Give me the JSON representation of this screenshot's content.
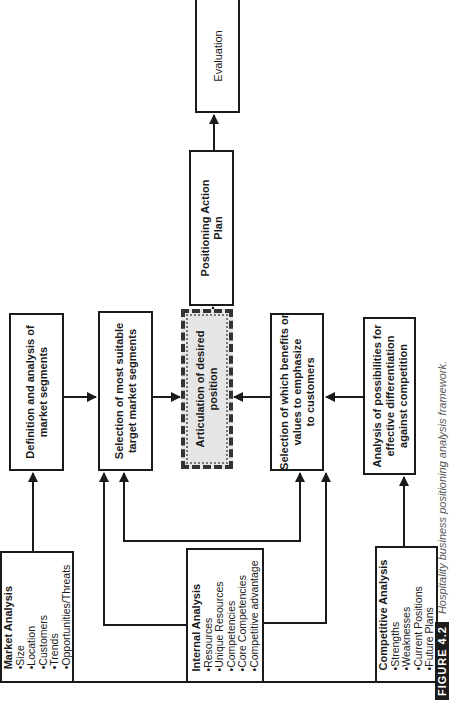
{
  "diagram": {
    "orientation": "rotated-90-ccw",
    "nodes": {
      "market_analysis": {
        "title": "Market Analysis",
        "items": [
          "•Size",
          "•Location",
          "•Customers",
          "•Trends",
          "•Opportunities/Threats"
        ]
      },
      "internal_analysis": {
        "title": "Internal Analysis",
        "items": [
          "•Resources",
          "•Unique Resources",
          "•Competencies",
          "•Core Competencies",
          "•Competitive advantage"
        ]
      },
      "competitive_analysis": {
        "title": "Competitive Analysis",
        "items": [
          "•Strengths",
          "•Weaknesses",
          "•Current Positions",
          "•Future Plans"
        ]
      },
      "definition_segments": {
        "line1": "Definition and analysis of",
        "line2": "market segments"
      },
      "selection_target": {
        "line1": "Selection of most suitable",
        "line2": "target market segments"
      },
      "articulation": {
        "line1": "Articulation of desired",
        "line2": "position"
      },
      "selection_benefits": {
        "line1": "Selection of which benefits or",
        "line2": "values to emphasize",
        "line3": "to customers"
      },
      "analysis_differentiation": {
        "line1": "Analysis of possibilities for",
        "line2": "effective differentiation",
        "line3": "against competition"
      },
      "action_plan": {
        "line1": "Positioning Action",
        "line2": "Plan"
      },
      "evaluation": {
        "line1": "Evaluation"
      }
    },
    "edges": [
      [
        "market_analysis",
        "definition_segments"
      ],
      [
        "internal_analysis",
        "selection_target"
      ],
      [
        "internal_analysis",
        "selection_benefits"
      ],
      [
        "definition_segments",
        "selection_target"
      ],
      [
        "selection_target",
        "articulation"
      ],
      [
        "selection_benefits",
        "articulation"
      ],
      [
        "analysis_differentiation",
        "selection_benefits"
      ],
      [
        "competitive_analysis",
        "analysis_differentiation"
      ],
      [
        "articulation",
        "action_plan"
      ],
      [
        "action_plan",
        "evaluation"
      ]
    ],
    "colors": {
      "line": "#1a1a1a",
      "highlight_fill": "#e6e6e6"
    }
  },
  "caption": {
    "label": "FIGURE 4.2",
    "text": "Hospitality business positioning analysis framework."
  }
}
